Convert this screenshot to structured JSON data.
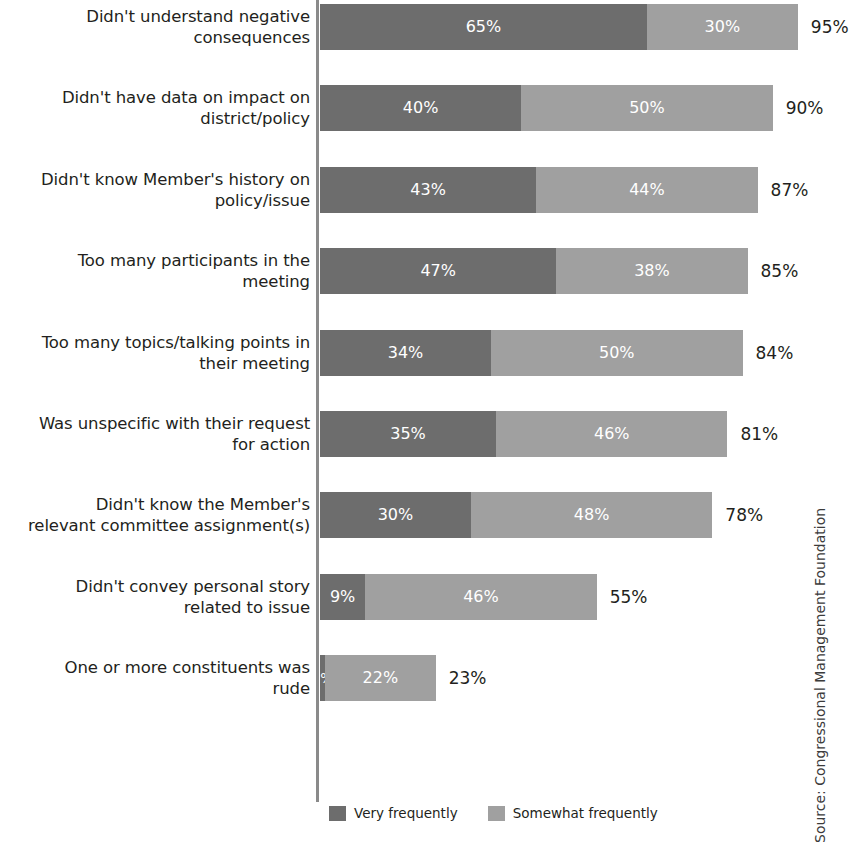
{
  "chart_data": {
    "type": "bar",
    "subtype": "horizontal-stacked",
    "title": "",
    "xlabel": "",
    "ylabel": "",
    "xlim": [
      0,
      100
    ],
    "grid": false,
    "legend_position": "bottom",
    "units": "percent",
    "categories": [
      "Didn't understand negative\nconsequences",
      "Didn't have data on impact on\ndistrict/policy",
      "Didn't know Member's history on\npolicy/issue",
      "Too many participants in the\nmeeting",
      "Too many topics/talking points in\ntheir meeting",
      "Was unspecific with their request\nfor action",
      "Didn't know the Member's\nrelevant committee assignment(s)",
      "Didn't convey personal story\nrelated to issue",
      "One or more constituents was\nrude"
    ],
    "series": [
      {
        "name": "Very frequently",
        "color": "#6d6d6d",
        "values": [
          65,
          40,
          43,
          47,
          34,
          35,
          30,
          9,
          1
        ],
        "labels": [
          "65%",
          "40%",
          "43%",
          "47%",
          "34%",
          "35%",
          "30%",
          "9%",
          "1%"
        ]
      },
      {
        "name": "Somewhat frequently",
        "color": "#a0a0a0",
        "values": [
          30,
          50,
          44,
          38,
          50,
          46,
          48,
          46,
          22
        ],
        "labels": [
          "30%",
          "50%",
          "44%",
          "38%",
          "50%",
          "46%",
          "48%",
          "46%",
          "22%"
        ]
      }
    ],
    "totals": [
      95,
      90,
      87,
      85,
      84,
      81,
      78,
      55,
      23
    ],
    "total_labels": [
      "95%",
      "90%",
      "87%",
      "85%",
      "84%",
      "81%",
      "78%",
      "55%",
      "23%"
    ]
  },
  "legend": {
    "items": [
      {
        "label": "Very frequently",
        "color": "#6d6d6d"
      },
      {
        "label": "Somewhat frequently",
        "color": "#a0a0a0"
      }
    ]
  },
  "source": {
    "text": "Source: Congressional Management Foundation"
  }
}
